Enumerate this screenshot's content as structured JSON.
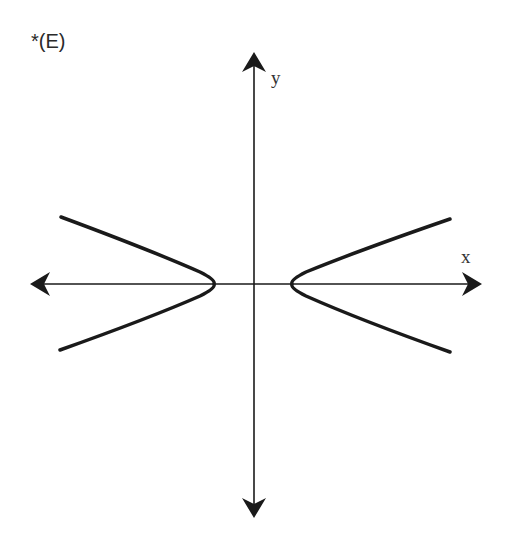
{
  "option": {
    "label": "*(E)"
  },
  "axes": {
    "x_label": "x",
    "y_label": "y"
  },
  "colors": {
    "stroke": "#1a1a1a",
    "background": "#ffffff"
  },
  "graph": {
    "type": "hyperbola",
    "orientation": "horizontal",
    "origin_px": [
      254,
      284
    ],
    "vertices_px": [
      [
        214,
        284
      ],
      [
        292,
        284
      ]
    ],
    "branches": [
      {
        "name": "left",
        "top_end_px": [
          61,
          217
        ],
        "vertex_px": [
          214,
          284
        ],
        "bottom_end_px": [
          60,
          350
        ]
      },
      {
        "name": "right",
        "top_end_px": [
          450,
          219
        ],
        "vertex_px": [
          292,
          284
        ],
        "bottom_end_px": [
          450,
          352
        ]
      }
    ]
  }
}
